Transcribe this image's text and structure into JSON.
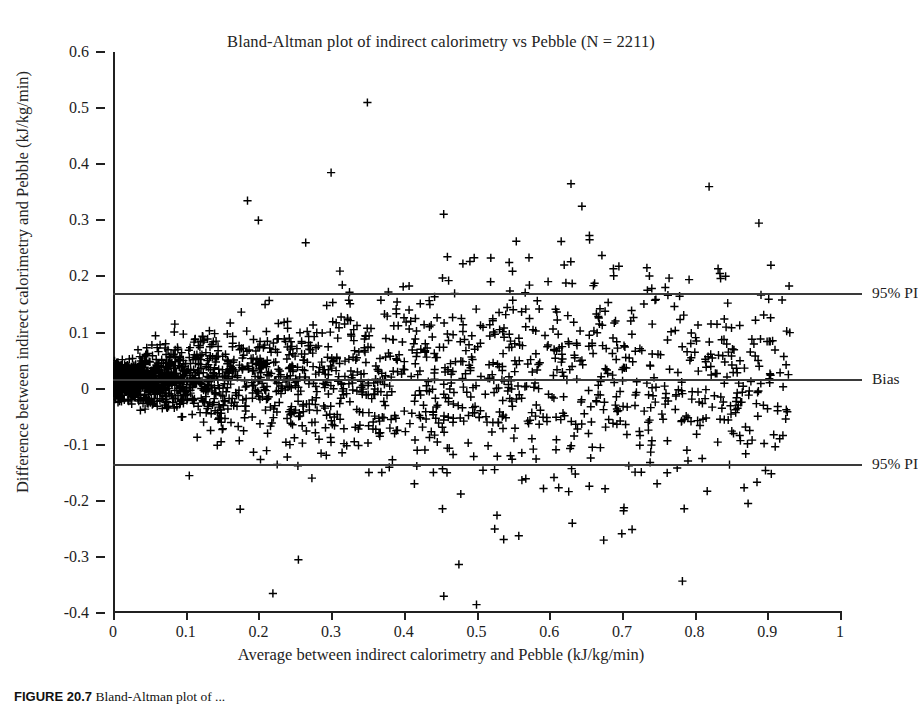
{
  "chart_data": {
    "type": "scatter",
    "title": "Bland-Altman plot of indirect calorimetry vs Pebble (N = 2211)",
    "xlabel": "Average between indirect calorimetry and Pebble (kJ/kg/min)",
    "ylabel": "Difference between indirect calorimetry and Pebble (kJ/kg/min)",
    "n_points": 2211,
    "marker": "plus",
    "marker_color": "#000000",
    "grid": false,
    "legend": "none",
    "xlim": [
      0,
      1
    ],
    "ylim": [
      -0.4,
      0.6
    ],
    "xticks": [
      "0",
      "0.1",
      "0.2",
      "0.3",
      "0.4",
      "0.5",
      "0.6",
      "0.7",
      "0.8",
      "0.9",
      "1"
    ],
    "xtick_values": [
      0,
      0.1,
      0.2,
      0.3,
      0.4,
      0.5,
      0.6,
      0.7,
      0.8,
      0.9,
      1
    ],
    "yticks": [
      "0.6",
      "0.5",
      "0.4",
      "0.3",
      "0.2",
      "0.1",
      "0",
      "-0.1",
      "-0.2",
      "-0.3",
      "-0.4"
    ],
    "ytick_values": [
      0.6,
      0.5,
      0.4,
      0.3,
      0.2,
      0.1,
      0,
      -0.1,
      -0.2,
      -0.3,
      -0.4
    ],
    "reference_lines": [
      {
        "label": "95% PI",
        "value": 0.17,
        "style": "solid",
        "color": "#3a3a3a"
      },
      {
        "label": "Bias",
        "value": 0.017,
        "style": "solid",
        "color": "#3a3a3a"
      },
      {
        "label": "95% PI",
        "value": -0.135,
        "style": "solid",
        "color": "#3a3a3a"
      }
    ],
    "annotations": [
      "Funnel-shaped scatter: spread of differences widens as the average increases",
      "Dense cluster of points near the origin (average < 0.15)"
    ],
    "notable_points": [
      {
        "x": 0.35,
        "y": 0.51
      },
      {
        "x": 0.3,
        "y": 0.385
      },
      {
        "x": 0.185,
        "y": 0.335
      },
      {
        "x": 0.2,
        "y": 0.3
      },
      {
        "x": 0.63,
        "y": 0.365
      },
      {
        "x": 0.645,
        "y": 0.325
      },
      {
        "x": 0.82,
        "y": 0.36
      },
      {
        "x": 0.265,
        "y": 0.26
      },
      {
        "x": 0.46,
        "y": 0.235
      },
      {
        "x": 0.545,
        "y": 0.225
      },
      {
        "x": 0.905,
        "y": 0.22
      },
      {
        "x": 0.255,
        "y": -0.305
      },
      {
        "x": 0.22,
        "y": -0.365
      },
      {
        "x": 0.455,
        "y": -0.37
      },
      {
        "x": 0.5,
        "y": -0.385
      },
      {
        "x": 0.525,
        "y": -0.25
      },
      {
        "x": 0.675,
        "y": -0.27
      },
      {
        "x": 0.105,
        "y": -0.155
      },
      {
        "x": 0.175,
        "y": -0.215
      }
    ]
  },
  "caption": {
    "figure_number": "FIGURE 20.7",
    "text": "Bland-Altman plot of ..."
  }
}
